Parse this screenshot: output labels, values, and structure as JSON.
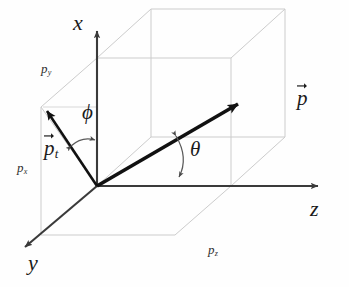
{
  "figure": {
    "background_color": "#fefefe",
    "line_color": "#3a3a3a",
    "vector_color": "#111111",
    "box_color": "#c9c9c9",
    "label_color": "#1a1a1a"
  },
  "axes": [
    {
      "id": "x",
      "label": "x",
      "label_x": 73,
      "label_y": 12,
      "direction": "up"
    },
    {
      "id": "y",
      "label": "y",
      "label_x": 28,
      "label_y": 252,
      "direction": "down-left"
    },
    {
      "id": "z",
      "label": "z",
      "label_x": 310,
      "label_y": 198,
      "direction": "right"
    }
  ],
  "vectors": [
    {
      "id": "p",
      "label": "p",
      "label_x": 297,
      "label_y": 88,
      "has_arrow_accent": true,
      "subscript": ""
    },
    {
      "id": "p_t",
      "label": "p",
      "subscript": "t",
      "label_x": 44,
      "label_y": 138,
      "has_arrow_accent": true
    }
  ],
  "angles": [
    {
      "id": "phi",
      "label": "ϕ",
      "label_x": 82,
      "label_y": 102,
      "description": "azimuthal angle between transverse vector p_t and x axis"
    },
    {
      "id": "theta",
      "label": "θ",
      "label_x": 190,
      "label_y": 139,
      "description": "polar angle between vector p and z axis"
    }
  ],
  "components": [
    {
      "id": "p_y",
      "label": "p",
      "subscript": "y",
      "label_x": 41,
      "label_y": 62
    },
    {
      "id": "p_x",
      "label": "p",
      "subscript": "x",
      "label_x": 17,
      "label_y": 161
    },
    {
      "id": "p_z",
      "label": "p",
      "subscript": "z",
      "label_x": 208,
      "label_y": 243
    }
  ],
  "geometry": {
    "origin": {
      "x": 97,
      "y": 186
    },
    "x_axis_tip": {
      "x": 97,
      "y": 27
    },
    "y_axis_tip": {
      "x": 21,
      "y": 250
    },
    "z_axis_tip": {
      "x": 322,
      "y": 186
    },
    "p_tip": {
      "x": 245,
      "y": 98
    },
    "pt_tip": {
      "x": 43,
      "y": 107
    },
    "box": {
      "front_bottom_left": {
        "x": 97,
        "y": 186
      },
      "front_bottom_right": {
        "x": 231,
        "y": 186
      },
      "front_top_left": {
        "x": 97,
        "y": 58
      },
      "front_top_right": {
        "x": 231,
        "y": 58
      },
      "back_offset": {
        "dx": -54,
        "dy": 49
      }
    }
  }
}
